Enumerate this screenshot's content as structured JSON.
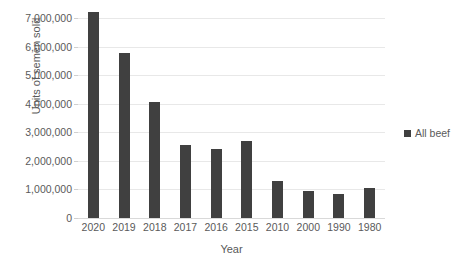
{
  "chart_data": {
    "type": "bar",
    "title": "",
    "xlabel": "Year",
    "ylabel": "Units of semen sold",
    "categories": [
      "2020",
      "2019",
      "2018",
      "2017",
      "2016",
      "2015",
      "2010",
      "2000",
      "1990",
      "1980"
    ],
    "values": [
      7210000,
      5790000,
      4060000,
      2540000,
      2410000,
      2690000,
      1280000,
      950000,
      840000,
      1030000
    ],
    "series": [
      {
        "name": "All beef",
        "color": "#404040",
        "values": [
          7210000,
          5790000,
          4060000,
          2540000,
          2410000,
          2690000,
          1280000,
          950000,
          840000,
          1030000
        ]
      }
    ],
    "ylim": [
      0,
      7000000
    ],
    "ytick_values": [
      0,
      1000000,
      2000000,
      3000000,
      4000000,
      5000000,
      6000000,
      7000000
    ],
    "ytick_labels": [
      "0",
      "1,000,000",
      "2,000,000",
      "3,000,000",
      "4,000,000",
      "5,000,000",
      "6,000,000",
      "7,000,000"
    ],
    "grid": true,
    "legend_position": "right",
    "legend": [
      "All beef"
    ]
  },
  "legend": {
    "entries": [
      {
        "label": "All beef",
        "swatch": "legend-swatch-icon"
      }
    ]
  },
  "axis": {
    "y_title": "Units of semen sold",
    "x_title": "Year"
  },
  "colors": {
    "bar": "#404040",
    "gridline": "#e8e8e8",
    "text": "#5a5a5a"
  }
}
